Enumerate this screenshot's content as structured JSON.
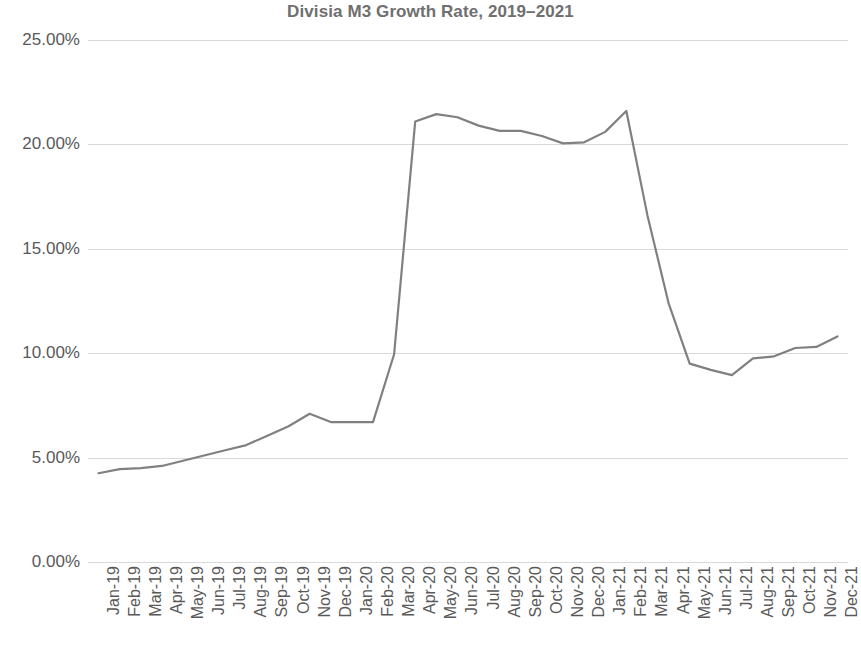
{
  "chart_data": {
    "type": "line",
    "title": "Divisia M3 Growth Rate, 2019–2021",
    "xlabel": "",
    "ylabel": "",
    "ylim": [
      0,
      25
    ],
    "ytick_labels": [
      "25.00%",
      "20.00%",
      "15.00%",
      "10.00%",
      "5.00%",
      "0.00%"
    ],
    "ytick_values": [
      25,
      20,
      15,
      10,
      5,
      0
    ],
    "grid": true,
    "legend": "none",
    "line_color": "#808080",
    "grid_color": "#d9d9d9",
    "text_color": "#595959",
    "title_color": "#6f6f6f",
    "categories": [
      "Jan-19",
      "Feb-19",
      "Mar-19",
      "Apr-19",
      "May-19",
      "Jun-19",
      "Jul-19",
      "Aug-19",
      "Sep-19",
      "Oct-19",
      "Nov-19",
      "Dec-19",
      "Jan-20",
      "Feb-20",
      "Mar-20",
      "Apr-20",
      "May-20",
      "Jun-20",
      "Jul-20",
      "Aug-20",
      "Sep-20",
      "Oct-20",
      "Nov-20",
      "Dec-20",
      "Jan-21",
      "Feb-21",
      "Mar-21",
      "Apr-21",
      "May-21",
      "Jun-21",
      "Jul-21",
      "Aug-21",
      "Sep-21",
      "Oct-21",
      "Nov-21",
      "Dec-21"
    ],
    "values": [
      4.25,
      4.45,
      4.5,
      4.6,
      4.85,
      5.1,
      5.35,
      5.6,
      6.05,
      6.5,
      7.1,
      6.7,
      6.7,
      6.7,
      9.95,
      21.1,
      21.45,
      21.3,
      20.9,
      20.65,
      20.65,
      20.4,
      20.05,
      20.1,
      20.6,
      21.6,
      16.6,
      12.4,
      9.5,
      9.2,
      8.95,
      9.75,
      9.85,
      10.25,
      10.3,
      10.8
    ],
    "series_name": "Divisia M3 Growth Rate"
  }
}
